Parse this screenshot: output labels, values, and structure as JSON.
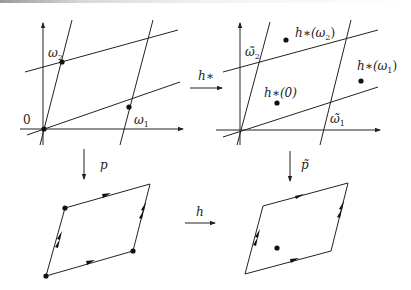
{
  "diagram": {
    "type": "commutative-diagram",
    "panels": {
      "top_left": {
        "description": "lattice in the plane with axes",
        "labels": {
          "origin": "0",
          "omega1": "ω",
          "omega1_sub": "1",
          "omega2": "ω",
          "omega2_sub": "2"
        }
      },
      "top_right": {
        "description": "transformed lattice with image points",
        "labels": {
          "omega1_tilde": "ω̃",
          "omega1_sub": "1",
          "omega2_tilde": "ω̃",
          "omega2_sub": "2",
          "h_omega2": "h∗(ω",
          "h_omega2_sub": "2",
          "h_omega2_close": ")",
          "h_omega1": "h∗(ω",
          "h_omega1_sub": "1",
          "h_omega1_close": ")",
          "h_zero": "h∗(0)"
        }
      },
      "bottom_left": {
        "description": "fundamental parallelogram (torus) with marked vertices"
      },
      "bottom_right": {
        "description": "fundamental parallelogram (torus) with one marked interior point"
      }
    },
    "arrows": {
      "top_horizontal": "h∗",
      "left_vertical": "p",
      "right_vertical": "p̃",
      "bottom_horizontal": "h"
    },
    "colors": {
      "ink": "#222222",
      "background": "#ffffff"
    }
  }
}
